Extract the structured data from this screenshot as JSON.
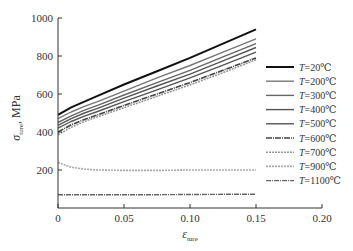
{
  "chart_data": {
    "type": "line",
    "title": "",
    "xlabel": "ε_ture",
    "ylabel": "σ_ture, MPa",
    "xlim": [
      0,
      0.2
    ],
    "ylim": [
      0,
      1000
    ],
    "xticks": [
      "0",
      "0.05",
      "0.10",
      "0.15",
      "0.20"
    ],
    "yticks": [
      "200",
      "400",
      "600",
      "800",
      "1000"
    ],
    "grid": false,
    "legend_position": "right",
    "x": [
      0,
      0.01,
      0.02,
      0.03,
      0.05,
      0.075,
      0.1,
      0.125,
      0.15
    ],
    "series": [
      {
        "name": "T=20℃",
        "color": "#111111",
        "width": 2.0,
        "dash": "",
        "values": [
          490,
          530,
          560,
          590,
          650,
          720,
          790,
          865,
          940
        ]
      },
      {
        "name": "T=200℃",
        "color": "#777777",
        "width": 1.4,
        "dash": "",
        "values": [
          470,
          505,
          535,
          560,
          615,
          685,
          750,
          820,
          890
        ]
      },
      {
        "name": "T=300℃",
        "color": "#666666",
        "width": 1.4,
        "dash": "",
        "values": [
          450,
          485,
          515,
          540,
          595,
          660,
          725,
          795,
          865
        ]
      },
      {
        "name": "T=400℃",
        "color": "#555555",
        "width": 1.4,
        "dash": "",
        "values": [
          435,
          470,
          500,
          525,
          578,
          642,
          705,
          775,
          845
        ]
      },
      {
        "name": "T=500℃",
        "color": "#555555",
        "width": 1.4,
        "dash": "",
        "values": [
          420,
          455,
          483,
          508,
          560,
          622,
          685,
          752,
          820
        ]
      },
      {
        "name": "T=600℃",
        "color": "#444444",
        "width": 1.6,
        "dash": "6,1,1,1",
        "values": [
          400,
          438,
          466,
          490,
          540,
          600,
          660,
          725,
          790
        ]
      },
      {
        "name": "T=700℃",
        "color": "#999999",
        "width": 1.6,
        "dash": "2,1",
        "values": [
          385,
          425,
          455,
          480,
          528,
          588,
          648,
          712,
          780
        ]
      },
      {
        "name": "T=900℃",
        "color": "#aaaaaa",
        "width": 1.6,
        "dash": "2,1",
        "values": [
          240,
          215,
          205,
          200,
          198,
          198,
          200,
          200,
          200
        ]
      },
      {
        "name": "T=1100℃",
        "color": "#666666",
        "width": 1.4,
        "dash": "5,1,1,1",
        "values": [
          70,
          70,
          70,
          70,
          70,
          70,
          71,
          72,
          72
        ]
      }
    ]
  },
  "axes": {
    "ylabel_sigma": "σ",
    "ylabel_sub": "ture",
    "ylabel_unit": ", MPa",
    "xlabel_eps": "ε",
    "xlabel_sub": "ture",
    "x_zero": "0"
  },
  "legend": {
    "items": [
      {
        "prefix": "T",
        "label": "=20℃"
      },
      {
        "prefix": "T",
        "label": "=200℃"
      },
      {
        "prefix": "T",
        "label": "=300℃"
      },
      {
        "prefix": "T",
        "label": "=400℃"
      },
      {
        "prefix": "T",
        "label": "=500℃"
      },
      {
        "prefix": "T",
        "label": "=600℃"
      },
      {
        "prefix": "T",
        "label": "=700℃"
      },
      {
        "prefix": "T",
        "label": "=900℃"
      },
      {
        "prefix": "T",
        "label": "=1100℃"
      }
    ]
  }
}
